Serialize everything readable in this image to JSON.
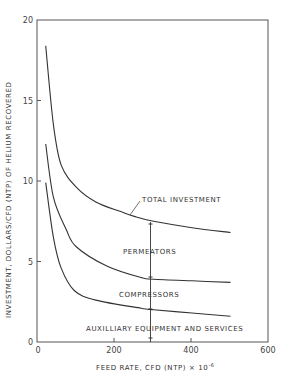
{
  "chart_data": {
    "type": "line",
    "title": "",
    "xlabel": "FEED RATE, CFD (NTP) × 10⁻⁶",
    "ylabel": "INVESTMENT, DOLLARS/CFD (NTP) OF HELIUM RECOVERED",
    "xlim": [
      0,
      600
    ],
    "ylim": [
      0,
      20
    ],
    "xticks": [
      0,
      200,
      400,
      600
    ],
    "yticks": [
      0,
      5,
      10,
      15,
      20
    ],
    "grid": false,
    "legend": "none (inline annotations)",
    "series": [
      {
        "name": "Total investment",
        "x": [
          20,
          40,
          60,
          100,
          150,
          215,
          250,
          300,
          400,
          500
        ],
        "y": [
          18.4,
          13.5,
          11.0,
          9.6,
          8.7,
          8.1,
          7.8,
          7.5,
          7.1,
          6.8
        ]
      },
      {
        "name": "Permeators + compressors boundary",
        "x": [
          20,
          40,
          73,
          100,
          180,
          268,
          300,
          400,
          500
        ],
        "y": [
          12.3,
          9.0,
          7.0,
          5.9,
          4.7,
          4.0,
          3.9,
          3.8,
          3.7
        ]
      },
      {
        "name": "Auxilliary equipment and services boundary",
        "x": [
          20,
          40,
          60,
          94,
          150,
          268,
          300,
          400,
          500
        ],
        "y": [
          9.9,
          6.5,
          4.6,
          3.2,
          2.6,
          2.1,
          2.0,
          1.8,
          1.6
        ]
      }
    ],
    "regions": [
      {
        "label": "PERMEATORS",
        "between": [
          "Total investment",
          "Permeators + compressors boundary"
        ]
      },
      {
        "label": "COMPRESSORS",
        "between": [
          "Permeators + compressors boundary",
          "Auxilliary equipment and services boundary"
        ]
      },
      {
        "label": "AUXILLIARY EQUIPMENT AND SERVICES",
        "between": [
          "Auxilliary equipment and services boundary",
          "x-axis"
        ]
      }
    ],
    "annotations": [
      {
        "text": "TOTAL INVESTMENT",
        "points_to": "Total investment"
      },
      {
        "text": "vertical reference line",
        "x": 295
      }
    ]
  },
  "labels": {
    "total": "TOTAL INVESTMENT",
    "permeators": "PERMEATORS",
    "compressors": "COMPRESSORS",
    "auxilliary": "AUXILLIARY EQUIPMENT AND SERVICES",
    "xlabel": "FEED RATE, CFD (NTP) × 10",
    "xlabel_exp": "-6",
    "ylabel": "INVESTMENT, DOLLARS/CFD (NTP) OF HELIUM RECOVERED"
  },
  "ticks": {
    "x": [
      "0",
      "200",
      "400",
      "600"
    ],
    "y": [
      "0",
      "5",
      "10",
      "15",
      "20"
    ]
  }
}
